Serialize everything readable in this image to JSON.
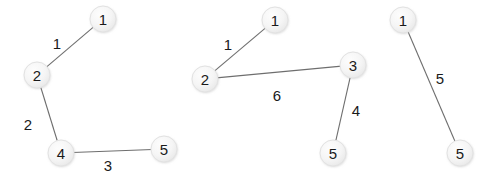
{
  "figure": {
    "background_color": "#ffffff",
    "width": 498,
    "height": 181,
    "node_fill_color": "#f4f4f4",
    "node_stroke_color": "#e2e2e2",
    "edge_color": "#6e6e6e",
    "label_color": "#1a1a1a",
    "node_radius": 13
  },
  "chart_data": {
    "type": "diagram",
    "title": "",
    "subtitle": "",
    "xlabel": "",
    "ylabel": "",
    "graphs": [
      {
        "name": "component-1",
        "nodes": [
          {
            "id": "g1-n1",
            "label": "1",
            "x": 103,
            "y": 19
          },
          {
            "id": "g1-n2",
            "label": "2",
            "x": 37,
            "y": 75
          },
          {
            "id": "g1-n4",
            "label": "4",
            "x": 61,
            "y": 153
          },
          {
            "id": "g1-n5",
            "label": "5",
            "x": 164,
            "y": 149
          }
        ],
        "edges": [
          {
            "from": "g1-n2",
            "to": "g1-n1",
            "weight": "1",
            "label_x": 57,
            "label_y": 43
          },
          {
            "from": "g1-n2",
            "to": "g1-n4",
            "weight": "2",
            "label_x": 28,
            "label_y": 124
          },
          {
            "from": "g1-n4",
            "to": "g1-n5",
            "weight": "3",
            "label_x": 108,
            "label_y": 165
          }
        ]
      },
      {
        "name": "component-2",
        "nodes": [
          {
            "id": "g2-n1",
            "label": "1",
            "x": 275,
            "y": 20
          },
          {
            "id": "g2-n2",
            "label": "2",
            "x": 205,
            "y": 79
          },
          {
            "id": "g2-n3",
            "label": "3",
            "x": 353,
            "y": 65
          },
          {
            "id": "g2-n5",
            "label": "5",
            "x": 333,
            "y": 153
          }
        ],
        "edges": [
          {
            "from": "g2-n2",
            "to": "g2-n1",
            "weight": "1",
            "label_x": 228,
            "label_y": 44
          },
          {
            "from": "g2-n2",
            "to": "g2-n3",
            "weight": "6",
            "label_x": 277,
            "label_y": 95
          },
          {
            "from": "g2-n3",
            "to": "g2-n5",
            "weight": "4",
            "label_x": 356,
            "label_y": 110
          }
        ]
      },
      {
        "name": "component-3",
        "nodes": [
          {
            "id": "g3-n1",
            "label": "1",
            "x": 403,
            "y": 20
          },
          {
            "id": "g3-n5",
            "label": "5",
            "x": 460,
            "y": 153
          }
        ],
        "edges": [
          {
            "from": "g3-n1",
            "to": "g3-n5",
            "weight": "5",
            "label_x": 440,
            "label_y": 78
          }
        ]
      }
    ]
  }
}
